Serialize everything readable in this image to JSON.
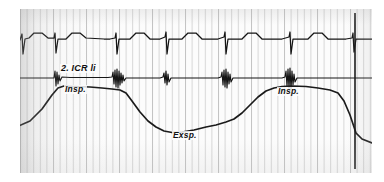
{
  "recording": {
    "title": "Phonocardiogram with ECG and respiration curve",
    "paper": {
      "background_color": "#fbfbfb",
      "grid_color": "#d8d8d8",
      "grid_spacing_px": 6.6,
      "trace_color": "#151515",
      "left_px": 20,
      "top_px": 9,
      "width_px": 352,
      "height_px": 164
    },
    "labels": {
      "auscultation_site": "2. ICR li",
      "inspiration_first": "Insp.",
      "expiration": "Exsp.",
      "inspiration_second": "Insp."
    },
    "channels": [
      {
        "name": "ecg",
        "display_name": "ECG",
        "baseline_y": 31,
        "qrs_positions_px": [
          3,
          35,
          97,
          146,
          205,
          270,
          333
        ],
        "qrs_amplitude_px": 17
      },
      {
        "name": "phonocardiogram",
        "display_name": "Phonokardiogramm",
        "baseline_y": 69,
        "burst_positions_px": [
          36,
          97,
          146,
          206,
          270,
          333
        ],
        "burst_amplitude_px": 9
      },
      {
        "name": "respiration",
        "display_name": "Atemkurve",
        "inspiration_peaks_px": [
          40,
          270
        ],
        "expiration_trough_px": 150
      }
    ],
    "timing_marker": {
      "name": "end-marker",
      "x_px": 335,
      "description": "vertical time / event marker line"
    }
  },
  "chart_data": {
    "type": "line",
    "xlabel": "",
    "ylabel": "",
    "grid": true,
    "legend": "none",
    "annotations": [
      {
        "text": "2. ICR li",
        "x": 60,
        "y": 64
      },
      {
        "text": "Insp.",
        "x": 64,
        "y": 85
      },
      {
        "text": "Exsp.",
        "x": 172,
        "y": 131
      },
      {
        "text": "Insp.",
        "x": 277,
        "y": 87
      }
    ],
    "series": [
      {
        "name": "ECG",
        "baseline": 31,
        "points": "M -8,31 L 0,31 L 2,25 L 3,45 L 5,30 L 9,29 L 14,24 L 22,24 L 28,29 L 34,29 L 35,24 L 36,44 L 38,30 L 42,30 L 46,30 L 52,24 L 60,24 L 66,29 L 84,30 L 90,30 L 95,29 L 96,24 L 97,45 L 99,30 L 104,30 L 110,30 L 116,24 L 124,24 L 130,30 L 140,30 L 145,28 L 146,23 L 147,45 L 149,30 L 156,30 L 162,30 L 168,24 L 176,24 L 182,30 L 198,30 L 204,28 L 205,23 L 206,45 L 208,30 L 214,30 L 222,30 L 228,24 L 236,24 L 242,30 L 262,30 L 269,28 L 270,23 L 271,45 L 273,30 L 280,30 L 288,30 L 294,24 L 302,24 L 308,30 L 326,30 L 332,29 L 333,24 L 334,43 L 336,30 L 344,30 L 352,30"
      },
      {
        "name": "Phonocardiogram",
        "baseline": 69,
        "points": "M -6,69 L 30,69 L 34,69 L 35,62 L 36,77 L 37,63 L 38,75 L 39,66 L 40,72 L 42,68 L 50,68.5 L 88,68.5 L 92,68 L 93,63 L 94,75 L 95,61 L 96,78 L 97,60 L 98,79 L 99,62 L 100,76 L 101,64 L 102,74 L 103,66 L 104,72 L 106,69 L 110,69 L 140,69 L 143,68 L 144,64 L 145,74 L 146,62 L 147,76 L 148,65 L 149,73 L 151,69 L 156,69 L 198,69 L 201,68 L 202,63 L 203,76 L 204,61 L 205,78 L 206,60 L 207,79 L 208,63 L 209,75 L 210,65 L 211,73 L 213,69 L 218,69 L 262,69 L 265,68 L 266,62 L 267,77 L 268,60 L 269,79 L 270,59 L 271,80 L 272,62 L 273,76 L 274,65 L 275,73 L 277,69 L 282,69 L 352,69"
      },
      {
        "name": "Respiration",
        "points": "M -8,120 L 10,112 L 22,100 L 32,86 L 38,79 L 44,77 L 54,77.5 L 70,78 L 82,79 L 92,80 L 100,81 L 106,84 L 112,92 L 120,103 L 128,112 L 136,118 L 144,122 L 152,123.5 L 162,123 L 174,121 L 186,118 L 196,116 L 206,113 L 214,110 L 222,104 L 230,96 L 238,88 L 246,82 L 254,79 L 262,77.5 L 272,77 L 286,77.5 L 298,79 L 310,81 L 318,84 L 324,92 L 330,106 L 336,124 L 342,130 L 352,134"
      }
    ]
  }
}
